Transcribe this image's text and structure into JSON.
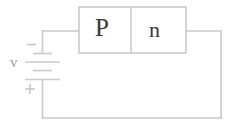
{
  "figure": {
    "type": "circuit-diagram"
  },
  "semiconductor_block": {
    "regions": [
      {
        "id": "p-region",
        "label": "P"
      },
      {
        "id": "n-region",
        "label": "n"
      }
    ],
    "border_color": "#c4c4c4",
    "fill_color": "#ffffff",
    "text_color": "#3a3a3a"
  },
  "source": {
    "symbol": "battery",
    "label": "v",
    "negative_terminal_label": "−",
    "positive_terminal_label": "+",
    "label_color": "#9d9d9d",
    "plate_count": 4
  },
  "wiring": {
    "stroke_color": "#c9c9c9",
    "segments": [
      {
        "id": "top-left-wire",
        "from": "battery-negative",
        "to": "p-region-left"
      },
      {
        "id": "right-wire",
        "from": "n-region-right",
        "to": "bottom-wire"
      },
      {
        "id": "bottom-wire",
        "from": "right-wire",
        "to": "battery-positive"
      }
    ]
  }
}
